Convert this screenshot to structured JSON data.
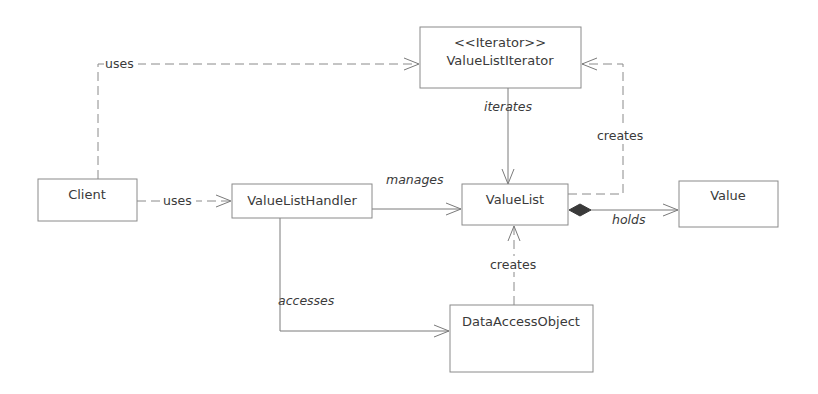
{
  "diagram": {
    "type": "UML class diagram",
    "classes": {
      "client": {
        "name": "Client"
      },
      "handler": {
        "name": "ValueListHandler"
      },
      "iterator": {
        "stereotype": "<<Iterator>>",
        "name": "ValueListIterator"
      },
      "valuelist": {
        "name": "ValueList"
      },
      "value": {
        "name": "Value"
      },
      "dao": {
        "name": "DataAccessObject"
      }
    },
    "relations": {
      "client_uses_iterator": {
        "label": "uses",
        "from": "Client",
        "to": "ValueListIterator",
        "style": "dashed-dependency"
      },
      "client_uses_handler": {
        "label": "uses",
        "from": "Client",
        "to": "ValueListHandler",
        "style": "dashed-dependency"
      },
      "handler_manages_valuelist": {
        "label": "manages",
        "from": "ValueListHandler",
        "to": "ValueList",
        "style": "association"
      },
      "iterator_iterates_valuelist": {
        "label": "iterates",
        "from": "ValueListIterator",
        "to": "ValueList",
        "style": "association"
      },
      "valuelist_creates_iterator": {
        "label": "creates",
        "from": "ValueList",
        "to": "ValueListIterator",
        "style": "dashed-dependency"
      },
      "valuelist_holds_value": {
        "label": "holds",
        "from": "ValueList",
        "to": "Value",
        "style": "composition"
      },
      "handler_accesses_dao": {
        "label": "accesses",
        "from": "ValueListHandler",
        "to": "DataAccessObject",
        "style": "association"
      },
      "dao_creates_valuelist": {
        "label": "creates",
        "from": "DataAccessObject",
        "to": "ValueList",
        "style": "dashed-dependency"
      }
    }
  }
}
